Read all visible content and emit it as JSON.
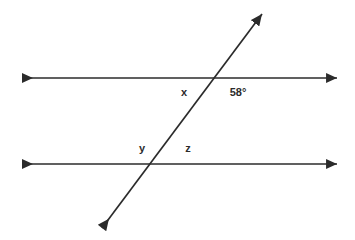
{
  "figure": {
    "background_color": "#ffffff",
    "stroke_color": "#2b2b2b",
    "label_color": "#2b2b2b",
    "stroke_width": 1.6,
    "width": 355,
    "height": 240
  },
  "lines": [
    {
      "name": "upper-parallel-line",
      "kind": "double-arrow-line",
      "x1": 22,
      "y1": 78,
      "x2": 337,
      "y2": 78
    },
    {
      "name": "lower-parallel-line",
      "kind": "double-arrow-line",
      "x1": 22,
      "y1": 164,
      "x2": 337,
      "y2": 164
    },
    {
      "name": "transversal-line",
      "kind": "double-arrow-line",
      "x1": 102,
      "y1": 228,
      "x2": 262,
      "y2": 14
    }
  ],
  "intersections": [
    {
      "name": "upper-intersection",
      "x": 214,
      "y": 78
    },
    {
      "name": "lower-intersection",
      "x": 151,
      "y": 164
    }
  ],
  "labels": [
    {
      "name": "angle-label-x",
      "text": "x",
      "x": 184,
      "y": 92
    },
    {
      "name": "angle-label-58",
      "text": "58°",
      "x": 238,
      "y": 92
    },
    {
      "name": "angle-label-y",
      "text": "y",
      "x": 142,
      "y": 148
    },
    {
      "name": "angle-label-z",
      "text": "z",
      "x": 188,
      "y": 148
    }
  ],
  "chart_data": {
    "type": "diagram",
    "known_angle": {
      "label": "58°",
      "value": 58,
      "unit": "degrees"
    },
    "unknown_angles": [
      "x",
      "y",
      "z"
    ]
  }
}
